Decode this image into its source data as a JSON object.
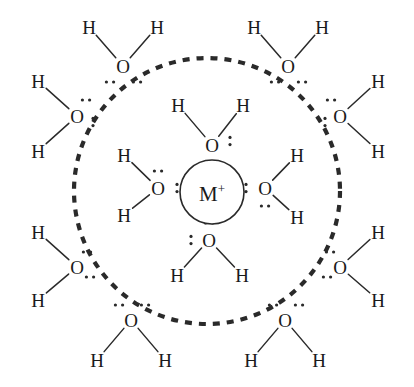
{
  "figure": {
    "type": "chemical-structure-diagram",
    "background_color": "#ffffff",
    "stroke_color": "#2a2a2a",
    "text_color": "#1a1a1a",
    "width": 414,
    "height": 387
  },
  "central_ion": {
    "label": "M",
    "charge": "+",
    "cx": 212,
    "cy": 192,
    "r": 32
  },
  "boundary": {
    "name": "inner-hydration-shell-boundary",
    "style": "dashed",
    "cx": 207,
    "cy": 191,
    "r": 133,
    "dash": "7 7",
    "stroke_width": 4.2
  },
  "atom_labels": {
    "oxygen": "O",
    "hydrogen": "H"
  },
  "inner_shell": [
    {
      "name": "water-inner-top",
      "o": {
        "x": 212,
        "y": 145
      },
      "h": [
        {
          "x": 178,
          "y": 105
        },
        {
          "x": 243,
          "y": 105
        }
      ],
      "lone_pairs": [
        {
          "x": 230,
          "y": 141,
          "angle": 90
        },
        {
          "x": 212,
          "y": 163,
          "angle": 0
        }
      ]
    },
    {
      "name": "water-inner-left",
      "o": {
        "x": 158,
        "y": 188
      },
      "h": [
        {
          "x": 124,
          "y": 155
        },
        {
          "x": 124,
          "y": 215
        }
      ],
      "lone_pairs": [
        {
          "x": 158,
          "y": 171,
          "angle": 0
        },
        {
          "x": 177,
          "y": 188,
          "angle": 90
        }
      ]
    },
    {
      "name": "water-inner-right",
      "o": {
        "x": 265,
        "y": 188
      },
      "h": [
        {
          "x": 297,
          "y": 155
        },
        {
          "x": 297,
          "y": 217
        }
      ],
      "lone_pairs": [
        {
          "x": 246,
          "y": 188,
          "angle": 90
        },
        {
          "x": 265,
          "y": 206,
          "angle": 0
        }
      ]
    },
    {
      "name": "water-inner-bottom",
      "o": {
        "x": 209,
        "y": 240
      },
      "h": [
        {
          "x": 177,
          "y": 275
        },
        {
          "x": 242,
          "y": 275
        }
      ],
      "lone_pairs": [
        {
          "x": 209,
          "y": 223,
          "angle": 0
        },
        {
          "x": 191,
          "y": 240,
          "angle": 90
        }
      ]
    }
  ],
  "outer_shell": [
    {
      "name": "water-outer-top-left",
      "o": {
        "x": 123,
        "y": 66
      },
      "h": [
        {
          "x": 89,
          "y": 27
        },
        {
          "x": 157,
          "y": 27
        }
      ],
      "lone_pairs": [
        {
          "x": 110,
          "y": 82,
          "angle": 0
        },
        {
          "x": 137,
          "y": 82,
          "angle": 0
        }
      ]
    },
    {
      "name": "water-outer-top-right",
      "o": {
        "x": 288,
        "y": 66
      },
      "h": [
        {
          "x": 254,
          "y": 27
        },
        {
          "x": 322,
          "y": 27
        }
      ],
      "lone_pairs": [
        {
          "x": 275,
          "y": 82,
          "angle": 0
        },
        {
          "x": 302,
          "y": 82,
          "angle": 0
        }
      ]
    },
    {
      "name": "water-outer-left-upper",
      "o": {
        "x": 77,
        "y": 116
      },
      "h": [
        {
          "x": 38,
          "y": 81
        },
        {
          "x": 38,
          "y": 151
        }
      ],
      "lone_pairs": [
        {
          "x": 86,
          "y": 100,
          "angle": 0
        },
        {
          "x": 93,
          "y": 122,
          "angle": 90
        }
      ]
    },
    {
      "name": "water-outer-right-upper",
      "o": {
        "x": 340,
        "y": 116
      },
      "h": [
        {
          "x": 378,
          "y": 81
        },
        {
          "x": 378,
          "y": 151
        }
      ],
      "lone_pairs": [
        {
          "x": 331,
          "y": 100,
          "angle": 0
        },
        {
          "x": 325,
          "y": 122,
          "angle": 90
        }
      ]
    },
    {
      "name": "water-outer-left-lower",
      "o": {
        "x": 77,
        "y": 267
      },
      "h": [
        {
          "x": 38,
          "y": 232
        },
        {
          "x": 38,
          "y": 300
        }
      ],
      "lone_pairs": [
        {
          "x": 87,
          "y": 252,
          "angle": 0
        },
        {
          "x": 90,
          "y": 277,
          "angle": 0
        }
      ]
    },
    {
      "name": "water-outer-right-lower",
      "o": {
        "x": 340,
        "y": 267
      },
      "h": [
        {
          "x": 378,
          "y": 232
        },
        {
          "x": 378,
          "y": 300
        }
      ],
      "lone_pairs": [
        {
          "x": 330,
          "y": 252,
          "angle": 0
        },
        {
          "x": 327,
          "y": 277,
          "angle": 0
        }
      ]
    },
    {
      "name": "water-outer-bottom-left",
      "o": {
        "x": 131,
        "y": 320
      },
      "h": [
        {
          "x": 97,
          "y": 360
        },
        {
          "x": 165,
          "y": 360
        }
      ],
      "lone_pairs": [
        {
          "x": 119,
          "y": 305,
          "angle": 0
        },
        {
          "x": 145,
          "y": 305,
          "angle": 0
        }
      ]
    },
    {
      "name": "water-outer-bottom-right",
      "o": {
        "x": 285,
        "y": 320
      },
      "h": [
        {
          "x": 251,
          "y": 360
        },
        {
          "x": 319,
          "y": 360
        }
      ],
      "lone_pairs": [
        {
          "x": 273,
          "y": 305,
          "angle": 0
        },
        {
          "x": 299,
          "y": 305,
          "angle": 0
        }
      ]
    }
  ]
}
